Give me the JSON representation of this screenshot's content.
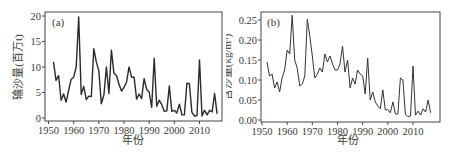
{
  "chart_data": [
    {
      "type": "line",
      "panel_label": "(a)",
      "title": "",
      "xlabel": "年份",
      "ylabel": "输沙量(百万t)",
      "xlim": [
        1950,
        2018
      ],
      "ylim": [
        0,
        20
      ],
      "xticks": [
        1950,
        1960,
        1970,
        1980,
        1990,
        2000,
        2010
      ],
      "yticks": [
        0,
        5,
        10,
        15,
        20
      ],
      "grid": false,
      "legend": null,
      "x": [
        1952,
        1953,
        1954,
        1955,
        1956,
        1957,
        1958,
        1959,
        1960,
        1961,
        1962,
        1963,
        1964,
        1965,
        1966,
        1967,
        1968,
        1969,
        1970,
        1971,
        1972,
        1973,
        1974,
        1975,
        1976,
        1977,
        1978,
        1979,
        1980,
        1981,
        1982,
        1983,
        1984,
        1985,
        1986,
        1987,
        1988,
        1989,
        1990,
        1991,
        1992,
        1993,
        1994,
        1995,
        1996,
        1997,
        1998,
        1999,
        2000,
        2001,
        2002,
        2003,
        2004,
        2005,
        2006,
        2007,
        2008,
        2009,
        2010,
        2011,
        2012,
        2013,
        2014,
        2015,
        2016,
        2017
      ],
      "series": [
        {
          "name": "输沙量",
          "values": [
            11.0,
            7.4,
            8.3,
            3.5,
            4.7,
            3.1,
            5.4,
            7.6,
            8.0,
            10.0,
            19.8,
            4.6,
            6.2,
            3.6,
            4.3,
            4.2,
            13.6,
            11.0,
            9.3,
            2.8,
            4.5,
            10.0,
            4.8,
            13.3,
            8.8,
            8.3,
            6.6,
            5.3,
            6.0,
            7.0,
            10.0,
            8.0,
            8.0,
            3.7,
            4.7,
            3.8,
            7.7,
            5.6,
            5.1,
            2.1,
            11.7,
            2.3,
            3.5,
            2.6,
            1.3,
            1.4,
            6.3,
            1.3,
            1.5,
            1.0,
            2.7,
            0.6,
            0.6,
            6.8,
            6.7,
            1.1,
            0.4,
            0.5,
            11.4,
            0.4,
            1.5,
            0.6,
            1.5,
            1.2,
            4.8,
            0.8
          ]
        }
      ]
    },
    {
      "type": "line",
      "panel_label": "(b)",
      "title": "",
      "xlabel": "年份",
      "ylabel": "含沙量(kg/m³)",
      "xlim": [
        1950,
        2018
      ],
      "ylim": [
        0,
        0.26
      ],
      "xticks": [
        1950,
        1960,
        1970,
        1980,
        1990,
        2000,
        2010
      ],
      "yticks": [
        0.0,
        0.05,
        0.1,
        0.15,
        0.2,
        0.25
      ],
      "ytick_labels": [
        "0.00",
        "0.05",
        "0.10",
        "0.15",
        "0.20",
        "0.25"
      ],
      "grid": false,
      "legend": null,
      "x": [
        1952,
        1953,
        1954,
        1955,
        1956,
        1957,
        1958,
        1959,
        1960,
        1961,
        1962,
        1963,
        1964,
        1965,
        1966,
        1967,
        1968,
        1969,
        1970,
        1971,
        1972,
        1973,
        1974,
        1975,
        1976,
        1977,
        1978,
        1979,
        1980,
        1981,
        1982,
        1983,
        1984,
        1985,
        1986,
        1987,
        1988,
        1989,
        1990,
        1991,
        1992,
        1993,
        1994,
        1995,
        1996,
        1997,
        1998,
        1999,
        2000,
        2001,
        2002,
        2003,
        2004,
        2005,
        2006,
        2007,
        2008,
        2009,
        2010,
        2011,
        2012,
        2013,
        2014,
        2015,
        2016,
        2017
      ],
      "series": [
        {
          "name": "含沙量",
          "values": [
            0.145,
            0.11,
            0.115,
            0.08,
            0.095,
            0.07,
            0.105,
            0.125,
            0.175,
            0.165,
            0.262,
            0.15,
            0.13,
            0.085,
            0.09,
            0.11,
            0.252,
            0.21,
            0.16,
            0.105,
            0.115,
            0.13,
            0.12,
            0.165,
            0.145,
            0.16,
            0.14,
            0.125,
            0.125,
            0.14,
            0.185,
            0.12,
            0.15,
            0.08,
            0.105,
            0.09,
            0.125,
            0.115,
            0.11,
            0.065,
            0.155,
            0.05,
            0.07,
            0.045,
            0.035,
            0.028,
            0.075,
            0.025,
            0.026,
            0.018,
            0.045,
            0.015,
            0.015,
            0.105,
            0.1,
            0.015,
            0.008,
            0.01,
            0.135,
            0.012,
            0.022,
            0.012,
            0.028,
            0.02,
            0.05,
            0.018
          ]
        }
      ]
    }
  ]
}
